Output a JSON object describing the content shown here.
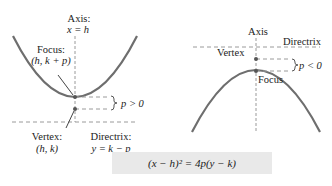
{
  "left_diagram": {
    "axis_title": "Axis:",
    "axis_eq": "x = h",
    "focus_title": "Focus:",
    "focus_coords": "(h, k + p)",
    "p_label": "p > 0",
    "vertex_title": "Vertex:",
    "vertex_coords": "(h, k)",
    "directrix_title": "Directrix:",
    "directrix_eq": "y = k − p"
  },
  "right_diagram": {
    "axis_title": "Axis",
    "directrix_title": "Directrix",
    "vertex_title": "Vertex",
    "focus_title": "Focus",
    "p_label": "p < 0"
  },
  "formula": "(x − h)² = 4p(y − k)",
  "colors": {
    "curve": "#6e6e6e",
    "dash": "#9a9a9a",
    "text": "#222222",
    "formula_bg": "#e9e9e9"
  }
}
